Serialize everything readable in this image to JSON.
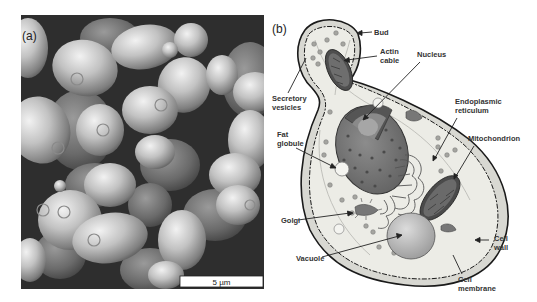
{
  "figure": {
    "panel_a": {
      "label": "(a)",
      "description": "Scanning electron micrograph of budding yeast cells",
      "scale_bar": "5 µm"
    },
    "panel_b": {
      "label": "(b)",
      "description": "Schematic of a budding yeast cell",
      "labels": {
        "bud": "Bud",
        "actin_1": "Actin",
        "actin_2": "cable",
        "nucleus": "Nucleus",
        "secretory_1": "Secretory",
        "secretory_2": "vesicles",
        "er_1": "Endoplasmic",
        "er_2": "reticulum",
        "fat_1": "Fat",
        "fat_2": "globule",
        "mito": "Mitochondrion",
        "golgi": "Golgi",
        "vacuole": "Vacuole",
        "wall_1": "Cell",
        "wall_2": "wall",
        "membrane_1": "Cell",
        "membrane_2": "membrane"
      }
    },
    "colors": {
      "background": "#ffffff",
      "sem_dark": "#2a2a2a",
      "sem_cell": "#b8b8b8",
      "cytoplasm": "#e6e6e0",
      "wall_outline": "#1a1a1a",
      "nucleus": "#7a7a7a",
      "mitochondrion": "#5a5a5a",
      "vacuole": "#c4c4c4",
      "label_text": "#333333"
    }
  }
}
